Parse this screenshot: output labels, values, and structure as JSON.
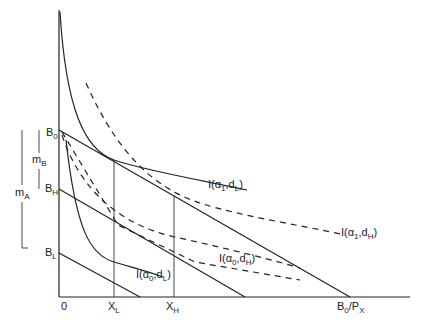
{
  "diagram": {
    "type": "indifference-curve budget diagram",
    "axes": {
      "origin_label": "0",
      "x_ticks": [
        {
          "base": "X",
          "sub": "L"
        },
        {
          "base": "X",
          "sub": "H"
        }
      ],
      "x_intercept": {
        "base": "B",
        "sub": "0",
        "suffix": "/P",
        "suffix_sub": "X"
      }
    },
    "y_labels": [
      {
        "base": "B",
        "sub": "0"
      },
      {
        "base": "B",
        "sub": "H"
      },
      {
        "base": "B",
        "sub": "L"
      }
    ],
    "brackets": [
      {
        "base": "m",
        "sub": "B"
      },
      {
        "base": "m",
        "sub": "A"
      }
    ],
    "curves": [
      {
        "id": "a1dL",
        "label_pre": "I(α",
        "a_sub": "1",
        "mid": ",d",
        "d_sub": "L",
        "close": ")",
        "style": "solid"
      },
      {
        "id": "a1dH",
        "label_pre": "I(α",
        "a_sub": "1",
        "mid": ",d",
        "d_sub": "H",
        "close": ")",
        "style": "dashed"
      },
      {
        "id": "a0dH",
        "label_pre": "I(α",
        "a_sub": "0",
        "mid": ",d",
        "d_sub": "H",
        "close": ")",
        "style": "dashed"
      },
      {
        "id": "a0dL",
        "label_pre": "I(α",
        "a_sub": "0",
        "mid": ",d",
        "d_sub": "L",
        "close": ")",
        "style": "solid"
      }
    ],
    "colors": {
      "line": "#222222",
      "background": "#ffffff"
    }
  }
}
